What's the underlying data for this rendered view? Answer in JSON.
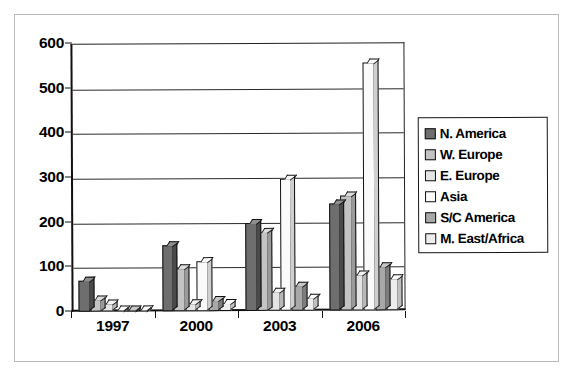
{
  "chart_data": {
    "type": "bar",
    "title": "",
    "subtitle": "",
    "xlabel": "",
    "ylabel": "",
    "categories": [
      "1997",
      "2000",
      "2003",
      "2006"
    ],
    "ylim": [
      0,
      600
    ],
    "yticks": [
      0,
      100,
      200,
      300,
      400,
      500,
      600
    ],
    "ytick_labels": [
      "0",
      "100",
      "200",
      "300",
      "400",
      "500",
      "600"
    ],
    "grid": true,
    "legend_position": "right",
    "style": "3d-grouped-bar",
    "series": [
      {
        "name": "N. America",
        "color": "#6e6e6e",
        "top_color": "#8f8f8f",
        "side_color": "#4a4a4a",
        "values": [
          70,
          148,
          197,
          240
        ]
      },
      {
        "name": "W. Europe",
        "color": "#c3c3c3",
        "top_color": "#dcdcdc",
        "side_color": "#9a9a9a",
        "values": [
          28,
          97,
          178,
          258
        ]
      },
      {
        "name": "E. Europe",
        "color": "#e4e4e4",
        "top_color": "#f2f2f2",
        "side_color": "#b8b8b8",
        "values": [
          18,
          18,
          43,
          80
        ]
      },
      {
        "name": "Asia",
        "color": "#fafafa",
        "top_color": "#ffffff",
        "side_color": "#cfcfcf",
        "values": [
          5,
          112,
          295,
          555
        ]
      },
      {
        "name": "S/C America",
        "color": "#a8a8a8",
        "top_color": "#c6c6c6",
        "side_color": "#7d7d7d",
        "values": [
          3,
          25,
          55,
          98
        ]
      },
      {
        "name": "M. East/Africa",
        "color": "#ededed",
        "top_color": "#f8f8f8",
        "side_color": "#c0c0c0",
        "values": [
          2,
          17,
          30,
          72
        ]
      }
    ]
  },
  "legend": {
    "items": [
      {
        "label": "N. America"
      },
      {
        "label": "W. Europe"
      },
      {
        "label": "E. Europe"
      },
      {
        "label": "Asia"
      },
      {
        "label": "S/C America"
      },
      {
        "label": "M. East/Africa"
      }
    ]
  },
  "axes": {
    "y_labels": [
      "600",
      "500",
      "400",
      "300",
      "200",
      "100",
      "0"
    ],
    "x_labels": [
      "1997",
      "2000",
      "2003",
      "2006"
    ]
  }
}
